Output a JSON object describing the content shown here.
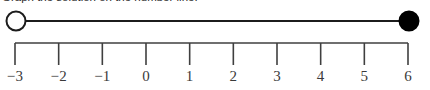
{
  "prompt": {
    "text": "Graph the solution on the number line."
  },
  "colors": {
    "background": "#ffffff",
    "line": "#1c1c1c",
    "axis": "#3f3f3f",
    "tick": "#3f3f3f",
    "label": "#3a3a3a",
    "endpoint_fill_closed": "#000000",
    "endpoint_fill_open": "#ffffff",
    "endpoint_stroke": "#1c1c1c"
  },
  "chart_data": {
    "type": "numberline",
    "title": "",
    "xlabel": "",
    "ylabel": "",
    "xlim": [
      -3,
      6
    ],
    "tick_step": 1,
    "grid": false,
    "categories": [
      "−3",
      "−2",
      "−1",
      "0",
      "1",
      "2",
      "3",
      "4",
      "5",
      "6"
    ],
    "values": [
      -3,
      -2,
      -1,
      0,
      1,
      2,
      3,
      4,
      5,
      6
    ],
    "ticks": [
      {
        "value": -3,
        "label": "−3"
      },
      {
        "value": -2,
        "label": "−2"
      },
      {
        "value": -1,
        "label": "−1"
      },
      {
        "value": 0,
        "label": "0"
      },
      {
        "value": 1,
        "label": "1"
      },
      {
        "value": 2,
        "label": "2"
      },
      {
        "value": 3,
        "label": "3"
      },
      {
        "value": 4,
        "label": "4"
      },
      {
        "value": 5,
        "label": "5"
      },
      {
        "value": 6,
        "label": "6"
      }
    ],
    "intervals": [
      {
        "start": -3,
        "end": 6,
        "start_endpoint": "open",
        "end_endpoint": "closed",
        "notation": "(−3, 6]"
      }
    ]
  },
  "geometry": {
    "left_px": 15,
    "right_px": 408,
    "segment_y": 21,
    "axis_y": 43,
    "tick_length": 22,
    "endpoint_radius": 9.5
  }
}
